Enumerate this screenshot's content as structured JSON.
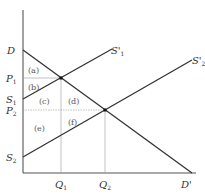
{
  "diagram": {
    "type": "supply-demand",
    "axes": {
      "y_axis": {
        "x": 23,
        "y_top": 10,
        "y_bottom": 173
      },
      "x_axis": {
        "y": 173,
        "x_left": 23,
        "x_right": 196
      }
    },
    "curves": {
      "demand": {
        "start_label": "D",
        "end_label": "D'",
        "x1": 23,
        "y1": 50,
        "x2": 192,
        "y2": 173
      },
      "supply1": {
        "start_label": "S",
        "start_sub": "1",
        "end_label": "S'",
        "end_sub": "1",
        "x1": 23,
        "y1": 99,
        "x2": 112,
        "y2": 49
      },
      "supply2": {
        "start_label": "S",
        "start_sub": "2",
        "end_label": "S'",
        "end_sub": "2",
        "x1": 23,
        "y1": 157,
        "x2": 192,
        "y2": 60
      }
    },
    "equilibria": [
      {
        "x": 61,
        "y": 78,
        "price_label": "P",
        "price_sub": "1",
        "qty_label": "Q",
        "qty_sub": "1"
      },
      {
        "x": 105,
        "y": 110,
        "price_label": "P",
        "price_sub": "2",
        "qty_label": "Q",
        "qty_sub": "2"
      }
    ],
    "regions": [
      {
        "label": "(a)",
        "x": 36,
        "y": 71
      },
      {
        "label": "(b)",
        "x": 36,
        "y": 88
      },
      {
        "label": "(c)",
        "x": 45,
        "y": 103
      },
      {
        "label": "(d)",
        "x": 73,
        "y": 103
      },
      {
        "label": "(e)",
        "x": 39,
        "y": 131
      },
      {
        "label": "(f)",
        "x": 73,
        "y": 124
      }
    ]
  }
}
